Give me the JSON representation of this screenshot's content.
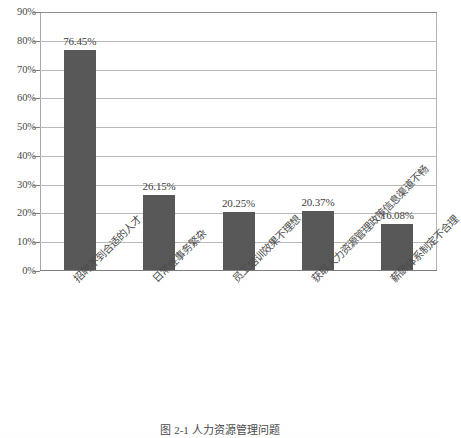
{
  "chart_data": {
    "type": "bar",
    "title": "",
    "subtitle": "",
    "xlabel": "",
    "ylabel": "",
    "ylim": [
      0,
      90
    ],
    "ytick_step": 10,
    "grid": true,
    "legend": false,
    "legend_position": "none",
    "bar_color": "#585858",
    "gridline_color": "#b9b9b9",
    "categories": [
      "招聘不到合适的人才",
      "日常性事务繁杂",
      "员工培训效果不理想",
      "获取人力资源管理政策信息渠道不畅",
      "薪酬体系制定不合理"
    ],
    "values": [
      76.45,
      26.15,
      20.25,
      20.37,
      16.08
    ],
    "value_labels": [
      "76.45%",
      "26.15%",
      "20.25%",
      "20.37%",
      "16.08%"
    ],
    "ytick_labels": [
      "0%",
      "10%",
      "20%",
      "30%",
      "40%",
      "50%",
      "60%",
      "70%",
      "80%",
      "90%"
    ],
    "ytick_values": [
      0,
      10,
      20,
      30,
      40,
      50,
      60,
      70,
      80,
      90
    ]
  },
  "caption": {
    "text": "图 2-1 人力资源管理问题"
  }
}
